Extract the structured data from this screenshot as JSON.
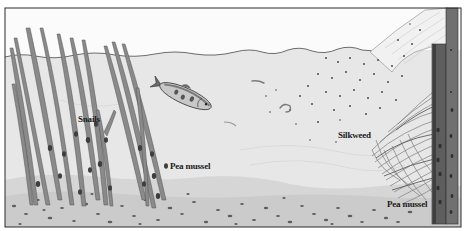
{
  "illustration": {
    "subject": "Underwater pond habitat cross-section",
    "colors": {
      "sky": "#fbfbfb",
      "water": "#e6e6e6",
      "water_line": "#4a4a4a",
      "sediment": "#d4d4d4",
      "pebble": "#5a5a5a",
      "weed_stem": "#7a7a7a",
      "weed_dark": "#3e3e3e",
      "post": "#5e5e5e",
      "frame": "#2a2a2a"
    },
    "labels": [
      {
        "id": "snails",
        "text": "Snails",
        "x": 78,
        "y": 115
      },
      {
        "id": "pea-mussel-left",
        "text": "Pea mussel",
        "x": 170,
        "y": 162
      },
      {
        "id": "silkweed",
        "text": "Silkweed",
        "x": 338,
        "y": 131
      },
      {
        "id": "pea-mussel-right",
        "text": "Pea mussel",
        "x": 387,
        "y": 200
      }
    ],
    "elements": [
      "reeds",
      "fish",
      "silkweed",
      "wooden-post",
      "pond-bottom",
      "sinking-particles"
    ]
  }
}
